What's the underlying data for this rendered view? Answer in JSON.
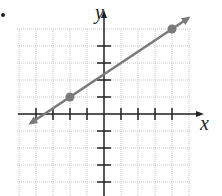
{
  "chart_data": {
    "type": "line",
    "title": "",
    "xlabel": "x",
    "ylabel": "y",
    "xlim": [
      -5,
      5
    ],
    "ylim": [
      -5,
      5
    ],
    "grid": true,
    "x_ticks": [
      -4,
      -3,
      -2,
      -1,
      1,
      2,
      3,
      4
    ],
    "y_ticks": [
      -4,
      -3,
      -2,
      -1,
      1,
      2,
      3,
      4
    ],
    "tick_labels_shown": false,
    "series": [
      {
        "name": "line",
        "equation": "y = (2/3)x + 7/3",
        "points": [
          {
            "x": -2,
            "y": 1
          },
          {
            "x": 4,
            "y": 5
          }
        ],
        "arrows_both_ends": true,
        "color": "#7a7a7a"
      }
    ]
  },
  "labels": {
    "x_axis": "x",
    "y_axis": "y"
  },
  "colors": {
    "axis": "#222222",
    "grid": "#c8c8c8",
    "line": "#7a7a7a",
    "point": "#7a7a7a"
  }
}
